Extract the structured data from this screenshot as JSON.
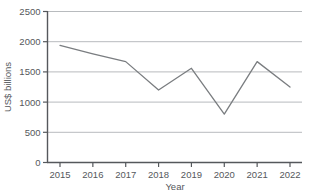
{
  "chart_data": {
    "type": "line",
    "title": "",
    "subtitle": "",
    "xlabel": "Year",
    "ylabel": "US$ billions",
    "categories": [
      "2015",
      "2016",
      "2017",
      "2018",
      "2019",
      "2020",
      "2021",
      "2022"
    ],
    "x": [
      2015,
      2016,
      2017,
      2018,
      2019,
      2020,
      2021,
      2022
    ],
    "values": [
      1940,
      1800,
      1670,
      1200,
      1560,
      800,
      1670,
      1250
    ],
    "series": [
      {
        "name": "US$ billions",
        "values": [
          1940,
          1800,
          1670,
          1200,
          1560,
          800,
          1670,
          1250
        ]
      }
    ],
    "ylim": [
      0,
      2500
    ],
    "y_ticks": [
      0,
      500,
      1000,
      1500,
      2000,
      2500
    ],
    "y_tick_labels": [
      "0",
      "500",
      "1000",
      "1500",
      "2000",
      "2500"
    ],
    "x_tick_labels": [
      "2015",
      "2016",
      "2017",
      "2018",
      "2019",
      "2020",
      "2021",
      "2022"
    ],
    "grid": true,
    "grid_axis": "y",
    "legend": false,
    "legend_position": "none",
    "markers": false,
    "line_color": "#7a7d80",
    "grid_color": "#b8bbbe",
    "axis_color": "#55585c",
    "text_color": "#55585c",
    "background_color": "#ffffff"
  }
}
